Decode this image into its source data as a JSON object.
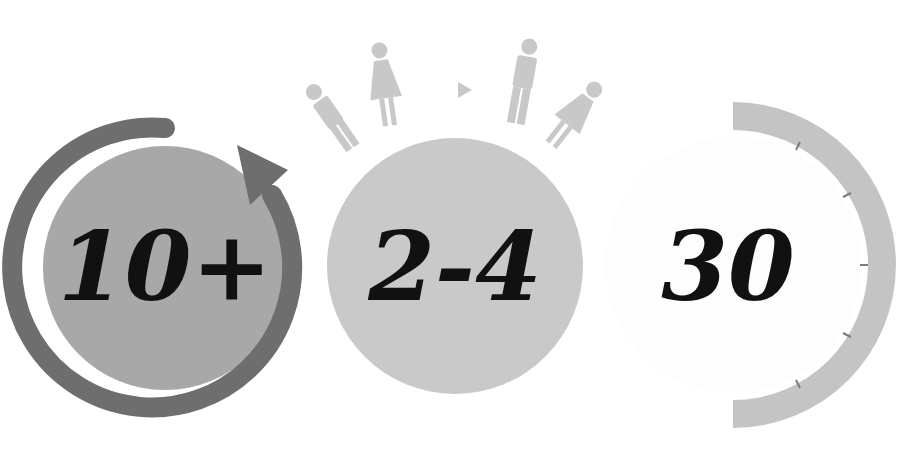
{
  "colors": {
    "background": "#ffffff",
    "dark_ring": "#6e6e6e",
    "circle1_fill": "#a8a8a8",
    "circle2_fill": "#c9c9c9",
    "people": "#c8c8c8",
    "timer_arc": "#c4c4c4",
    "circle3_fill": "#ffffff",
    "text": "#111111"
  },
  "items": [
    {
      "id": "repeat",
      "value": "10+",
      "icon": "circular-arrow-icon"
    },
    {
      "id": "people",
      "value": "2-4",
      "icon": "people-group-icon"
    },
    {
      "id": "time",
      "value": "30",
      "icon": "timer-dial-icon"
    }
  ]
}
